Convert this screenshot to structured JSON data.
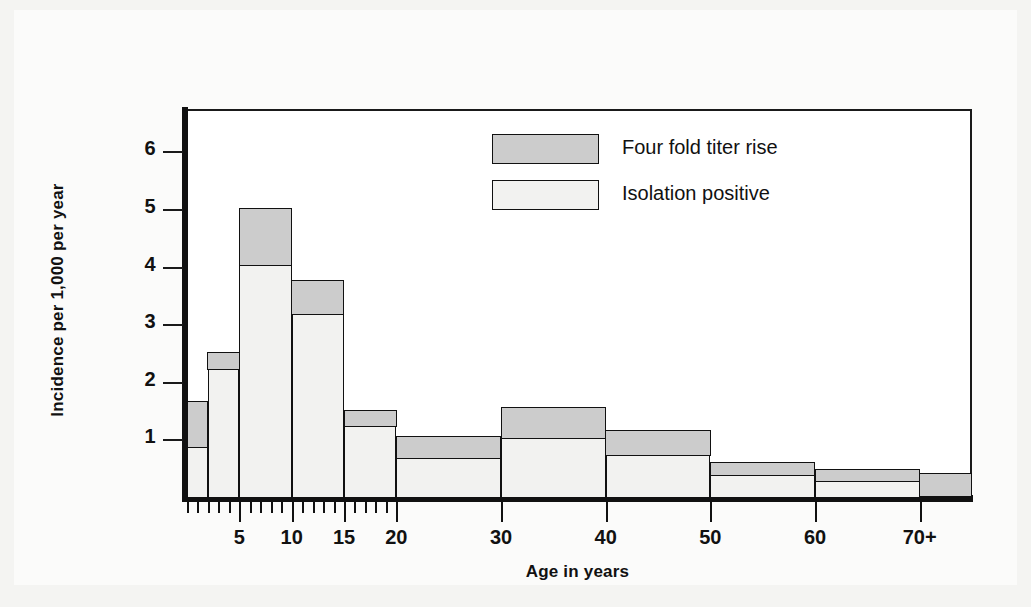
{
  "chart_data": {
    "type": "bar",
    "title": "",
    "subtitle": "",
    "xlabel": "Age in years",
    "ylabel": "Incidence per 1,000 per year",
    "stacked": true,
    "grid": false,
    "legend_position": "inside-top-center",
    "xlim": [
      0,
      75
    ],
    "ylim": [
      0,
      6.7
    ],
    "y_ticks": [
      "1",
      "2",
      "3",
      "4",
      "5",
      "6"
    ],
    "y_tick_values": [
      1,
      2,
      3,
      4,
      5,
      6
    ],
    "x_ticks": [
      "5",
      "10",
      "15",
      "20",
      "30",
      "40",
      "50",
      "60",
      "70+"
    ],
    "x_tick_values": [
      5,
      10,
      15,
      20,
      30,
      40,
      50,
      60,
      70
    ],
    "x_minor_ticks": [
      0,
      1,
      2,
      3,
      4,
      6,
      7,
      8,
      9,
      11,
      12,
      13,
      14,
      16,
      17,
      18,
      19
    ],
    "categories": [
      "0-2",
      "2-5",
      "5-10",
      "10-15",
      "15-20",
      "20-30",
      "30-40",
      "40-50",
      "50-60",
      "60-70",
      "70+"
    ],
    "bin_edges": [
      0,
      2,
      5,
      10,
      15,
      20,
      30,
      40,
      50,
      60,
      70,
      75
    ],
    "series": [
      {
        "name": "Isolation positive",
        "color": "#f2f2f0",
        "values": [
          0.85,
          2.2,
          4.0,
          3.15,
          1.2,
          0.65,
          1.0,
          0.7,
          0.35,
          0.25,
          0.0
        ]
      },
      {
        "name": "Four fold titer rise",
        "color": "#cccccc",
        "values": [
          0.8,
          0.3,
          1.0,
          0.6,
          0.3,
          0.4,
          0.55,
          0.45,
          0.25,
          0.22,
          0.4
        ]
      }
    ],
    "totals": [
      1.65,
      2.5,
      5.0,
      3.75,
      1.5,
      1.05,
      1.55,
      1.15,
      0.6,
      0.47,
      0.4
    ]
  },
  "legend": {
    "items": [
      {
        "label": "Four fold titer rise",
        "swatch": "gray"
      },
      {
        "label": "Isolation positive",
        "swatch": "white"
      }
    ]
  },
  "axes": {
    "y_title": "Incidence per 1,000 per year",
    "x_title": "Age in years"
  }
}
